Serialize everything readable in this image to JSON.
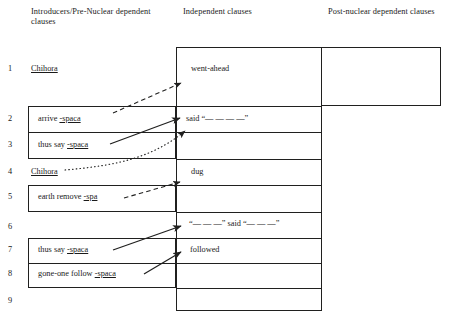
{
  "columns": {
    "introducers": "Introducers/Pre-Nuclear dependent clauses",
    "independent": "Independent clauses",
    "postnuclear": "Post-nuclear dependent clauses"
  },
  "rows": [
    {
      "num": "1",
      "left": "Chihora",
      "left_underline": "Chihora",
      "independent": "went-ahead",
      "post": ""
    },
    {
      "num": "2",
      "left": "arrive -spaca",
      "left_underline": "spaca",
      "independent": "said “— — — —”",
      "post": ""
    },
    {
      "num": "3",
      "left": "thus say -spaca",
      "left_underline": "spaca",
      "independent": "",
      "post": ""
    },
    {
      "num": "4",
      "left": "Chihora",
      "left_underline": "Chihora",
      "independent": "dug",
      "post": ""
    },
    {
      "num": "5",
      "left": "earth remove -spa",
      "left_underline": "spa",
      "independent": "",
      "post": ""
    },
    {
      "num": "6",
      "left": "",
      "left_underline": "",
      "independent": "“— — —” said “— — —”",
      "post": ""
    },
    {
      "num": "7",
      "left": "thus say -spaca",
      "left_underline": "spaca",
      "independent": "followed",
      "post": ""
    },
    {
      "num": "8",
      "left": "gone-one follow -spaca",
      "left_underline": "spaca",
      "independent": "",
      "post": ""
    },
    {
      "num": "9",
      "left": "",
      "left_underline": "",
      "independent": "",
      "post": ""
    }
  ],
  "arrows": [
    {
      "from_row": "2",
      "to_row": "1",
      "style": "dashed",
      "label": "arrive-spaca-to-went-ahead"
    },
    {
      "from_row": "3",
      "to_row": "2",
      "style": "solid",
      "label": "thus-say-spaca-to-said"
    },
    {
      "from_row": "4",
      "to_row": "2",
      "style": "dotted",
      "label": "chihora-to-said"
    },
    {
      "from_row": "5",
      "to_row": "4",
      "style": "dashed",
      "label": "earth-remove-spa-to-dug"
    },
    {
      "from_row": "7",
      "to_row": "6",
      "style": "solid",
      "label": "thus-say-spaca-to-quote-said"
    },
    {
      "from_row": "8",
      "to_row": "7",
      "style": "solid",
      "label": "gone-one-follow-spaca-to-followed"
    }
  ],
  "colors": {
    "stroke": "#20201f",
    "text": "#1a1a1a"
  }
}
